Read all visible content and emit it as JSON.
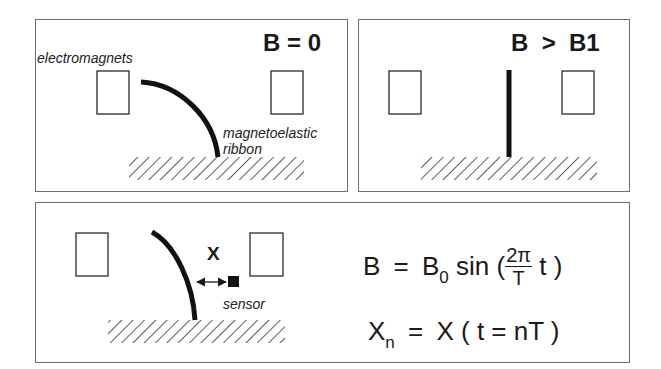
{
  "figure": {
    "panels": [
      {
        "id": "top-left",
        "title": "B = 0",
        "labels": {
          "electromagnets": "electromagnets",
          "ribbon_line1": "magnetoelastic",
          "ribbon_line2": "ribbon"
        },
        "ribbon_state": "bent"
      },
      {
        "id": "top-right",
        "title": "B  >  B1",
        "ribbon_state": "straight"
      },
      {
        "id": "bottom",
        "labels": {
          "displacement": "X",
          "sensor": "sensor"
        },
        "equations": {
          "eq1_lhs": "B",
          "eq1_eq": "=",
          "eq1_b": "B",
          "eq1_b_sub": "0",
          "eq1_sin": "sin (",
          "eq1_frac_num": "2π",
          "eq1_frac_den": "T",
          "eq1_tail": "t )",
          "eq2_lhs": "X",
          "eq2_lhs_sub": "n",
          "eq2_eq": "=",
          "eq2_rhs": "X ( t = nT )"
        }
      }
    ],
    "colors": {
      "border": "#6e6e6e",
      "ink": "#1a1a1a",
      "background": "#ffffff"
    }
  }
}
